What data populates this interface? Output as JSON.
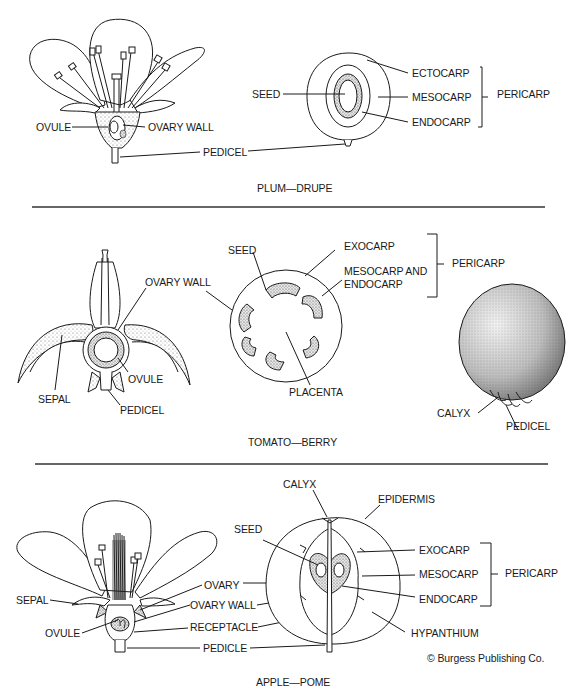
{
  "figure": {
    "sections": [
      {
        "caption": "PLUM—DRUPE",
        "flower_labels": {
          "ovule": "OVULE",
          "ovary_wall": "OVARY WALL",
          "pedicel": "PEDICEL"
        },
        "fruit_labels": {
          "seed": "SEED",
          "ectocarp": "ECTOCARP",
          "mesocarp": "MESOCARP",
          "endocarp": "ENDOCARP",
          "pericarp": "PERICARP"
        }
      },
      {
        "caption": "TOMATO—BERRY",
        "flower_labels": {
          "ovary_wall": "OVARY WALL",
          "ovule": "OVULE",
          "sepal": "SEPAL",
          "pedicel": "PEDICEL"
        },
        "fruit_labels": {
          "seed": "SEED",
          "exocarp": "EXOCARP",
          "mesocarp_and": "MESOCARP AND",
          "endocarp": "ENDOCARP",
          "pericarp": "PERICARP",
          "placenta": "PLACENTA"
        },
        "whole_fruit_labels": {
          "calyx": "CALYX",
          "pedicel": "PEDICEL"
        }
      },
      {
        "caption": "APPLE—POME",
        "flower_labels": {
          "sepal": "SEPAL",
          "ovule": "OVULE",
          "ovary": "OVARY",
          "ovary_wall": "OVARY WALL",
          "receptacle": "RECEPTACLE",
          "pedicle": "PEDICLE"
        },
        "fruit_labels": {
          "calyx": "CALYX",
          "epidermis": "EPIDERMIS",
          "seed": "SEED",
          "exocarp": "EXOCARP",
          "mesocarp": "MESOCARP",
          "endocarp": "ENDOCARP",
          "pericarp": "PERICARP",
          "hypanthium": "HYPANTHIUM"
        }
      }
    ],
    "credit": "© Burgess Publishing Co."
  }
}
